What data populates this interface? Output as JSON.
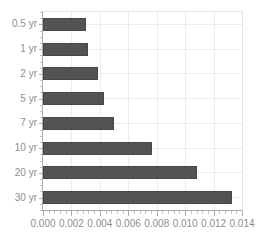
{
  "chart_data": {
    "type": "bar",
    "orientation": "horizontal",
    "title": "",
    "xlabel": "",
    "ylabel": "",
    "categories": [
      "0.5 yr",
      "1 yr",
      "2 yr",
      "5 yr",
      "7 yr",
      "10 yr",
      "20 yr",
      "30 yr"
    ],
    "values": [
      0.003,
      0.0032,
      0.0039,
      0.0043,
      0.005,
      0.0077,
      0.0108,
      0.0133
    ],
    "xlim": [
      0,
      0.014
    ],
    "x_tick_values": [
      0,
      0.002,
      0.004,
      0.006,
      0.008,
      0.01,
      0.012,
      0.014
    ],
    "x_tick_labels": [
      "0.000",
      "0.002",
      "0.004",
      "0.006",
      "0.008",
      "0.010",
      "0.012",
      "0.014"
    ],
    "minor_tick_step": 0.0004,
    "grid": true,
    "legend": false,
    "colors": {
      "bar": "#535353",
      "bar_edge": "#474747",
      "gridline": "#ececec",
      "axis": "#a8a8a8",
      "tick": "#aaaaaa",
      "minor_tick": "#c2c2c2",
      "label_text": "#8e8e8e",
      "background": "#ffffff"
    }
  }
}
